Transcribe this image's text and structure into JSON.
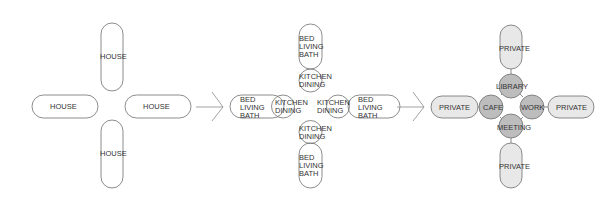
{
  "diagram": {
    "colors": {
      "stroke": "#6f6f6f",
      "pill_fill_stage3": "#e8e8e8",
      "circle_fill_stage3": "#bdbdbd",
      "text": "#333333"
    },
    "stage1": {
      "house_top": "HOUSE",
      "house_left": "HOUSE",
      "house_right": "HOUSE",
      "house_bottom": "HOUSE"
    },
    "stage2": {
      "top_pill": [
        "BED",
        "LIVING",
        "BATH"
      ],
      "top_circle": [
        "KITCHEN",
        "DINING"
      ],
      "left_pill": [
        "BED",
        "LIVING",
        "BATH"
      ],
      "left_circle": [
        "KITCHEN",
        "DINING"
      ],
      "right_circle": [
        "KITCHEN",
        "DINING"
      ],
      "right_pill": [
        "BED",
        "LIVING",
        "BATH"
      ],
      "bottom_circle": [
        "KITCHEN",
        "DINING"
      ],
      "bottom_pill": [
        "BED",
        "LIVING",
        "BATH"
      ]
    },
    "stage3": {
      "private_top": "PRIVATE",
      "private_left": "PRIVATE",
      "private_right": "PRIVATE",
      "private_bottom": "PRIVATE",
      "library": "LIBRARY",
      "cafe": "CAFE",
      "work": "WORK",
      "meeting": "MEETING"
    }
  }
}
